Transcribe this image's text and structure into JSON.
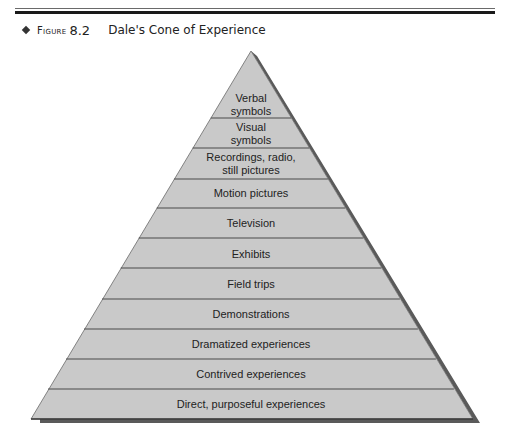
{
  "header": {
    "figure_label": "Figure",
    "figure_number": "8.2",
    "title": "Dale's Cone of Experience"
  },
  "diagram": {
    "type": "pyramid",
    "colors": {
      "fill": "#c9c9c9",
      "lines": "#4a4a4a",
      "shadow": "#5a5a5a"
    },
    "levels": [
      {
        "label_line1": "Verbal",
        "label_line2": "symbols"
      },
      {
        "label_line1": "Visual",
        "label_line2": "symbols"
      },
      {
        "label_line1": "Recordings, radio,",
        "label_line2": "still pictures"
      },
      {
        "label_line1": "Motion pictures",
        "label_line2": ""
      },
      {
        "label_line1": "Television",
        "label_line2": ""
      },
      {
        "label_line1": "Exhibits",
        "label_line2": ""
      },
      {
        "label_line1": "Field trips",
        "label_line2": ""
      },
      {
        "label_line1": "Demonstrations",
        "label_line2": ""
      },
      {
        "label_line1": "Dramatized experiences",
        "label_line2": ""
      },
      {
        "label_line1": "Contrived experiences",
        "label_line2": ""
      },
      {
        "label_line1": "Direct, purposeful experiences",
        "label_line2": ""
      }
    ]
  }
}
